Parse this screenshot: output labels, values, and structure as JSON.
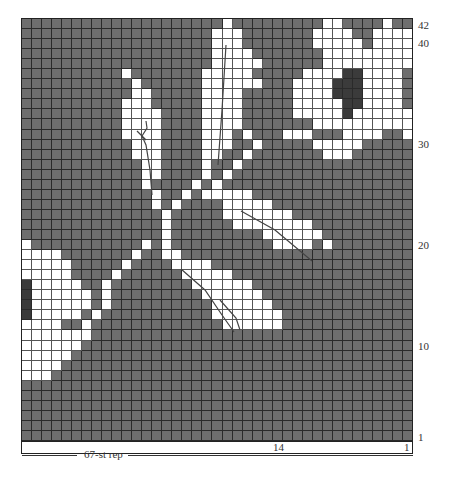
{
  "chart": {
    "columns": 39,
    "rows": 42,
    "colors": {
      "background": "#6e6e6e",
      "contrast": "#ffffff",
      "accent": "#3b3b3b",
      "grid": "#2a2a2a"
    },
    "row_labels": [
      {
        "label": "42",
        "row": 42
      },
      {
        "label": "40",
        "row": 40
      },
      {
        "label": "30",
        "row": 30
      },
      {
        "label": "20",
        "row": 20
      },
      {
        "label": "10",
        "row": 10
      },
      {
        "label": "1",
        "row": 1
      }
    ],
    "footer_labels": [
      {
        "label": "14",
        "col_from_right": 14
      },
      {
        "label": "1",
        "col_from_right": 1
      }
    ],
    "repeat_label": "67-st rep",
    "grid_rows": [
      "....................w.........ww....w...",
      "...................www.......wwww..wwww.",
      "...................www.......wwwww.wwwww",
      "...................wwww.......wwwwwwwwww",
      "...................wwwww......wwwwwwwwww",
      "..........w.......wwwww.....wwwwddwwww..",
      "...........w......wwwwww...wwwwdddwwww..",
      "...........ww.....wwww.....wwwwdddwwww..",
      "..........www.....wwww.....wwwwwddwwww..",
      "..........wwww....wwww.....wwwwwdwwwwww.",
      "..........wwww....wwww.......wwwwwwwwww.",
      "..........wwww....www.w...www...wwww..ww.",
      "...........www....www..w.....wwwww......",
      "...........www....ww..w.......www.......",
      "............ww....w..w..................",
      "............ww....w.w...................",
      "............w....w.w....................",
      ".............w..w.wwwww.................",
      ".............w.w....wwwww...............",
      "..............w.....wwwwwww.............",
      "..............w......wwwwwwww...........",
      "..............w.........wwwwww..........",
      "w...........w.w..........wwww.w.........",
      "wwww.......w..ww........................",
      "wwwww.....w....wwww.....................",
      "wwwww....w......wwwww...................",
      "dwwwww..w........wwwwww.................",
      "dwwwwww.w.........wwwwww................",
      "dwwwwww.w..........wwwwww...............",
      "dwwwww.w...........wwwwwww..............",
      "wwww..w.............wwwwww..............",
      "wwwwwww.................................",
      "wwwwww..................................",
      "wwwww...................................",
      "wwww....................................",
      "www.....................................",
      ".......................................",
      ".......................................",
      ".......................................",
      ".......................................",
      ".......................................",
      "......................................."
    ]
  },
  "chart_data": {
    "type": "heatmap",
    "xlabel": "67-st rep",
    "ylabel": "Rows",
    "x_tick_labels": [
      "14",
      "1"
    ],
    "y_tick_labels": [
      "1",
      "10",
      "20",
      "30",
      "40",
      "42"
    ],
    "legend": {
      "grey": "main color",
      "white": "contrast color (flowers/leaves/stem)",
      "dark": "flower center"
    },
    "grid_size": [
      39,
      42
    ]
  }
}
